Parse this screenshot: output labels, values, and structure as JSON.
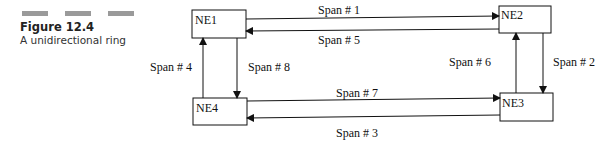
{
  "figure": {
    "number": "Figure 12.4",
    "caption": "A unidirectional ring"
  },
  "nodes": [
    {
      "id": "NE1",
      "label": "NE1"
    },
    {
      "id": "NE2",
      "label": "NE2"
    },
    {
      "id": "NE3",
      "label": "NE3"
    },
    {
      "id": "NE4",
      "label": "NE4"
    }
  ],
  "spans": [
    {
      "label": "Span # 1",
      "from": "NE1",
      "to": "NE2"
    },
    {
      "label": "Span # 2",
      "from": "NE2",
      "to": "NE3"
    },
    {
      "label": "Span # 3",
      "from": "NE3",
      "to": "NE4"
    },
    {
      "label": "Span # 4",
      "from": "NE4",
      "to": "NE1"
    },
    {
      "label": "Span # 5",
      "from": "NE2",
      "to": "NE1"
    },
    {
      "label": "Span # 6",
      "from": "NE3",
      "to": "NE2"
    },
    {
      "label": "Span # 7",
      "from": "NE4",
      "to": "NE3"
    },
    {
      "label": "Span # 8",
      "from": "NE1",
      "to": "NE4"
    }
  ]
}
